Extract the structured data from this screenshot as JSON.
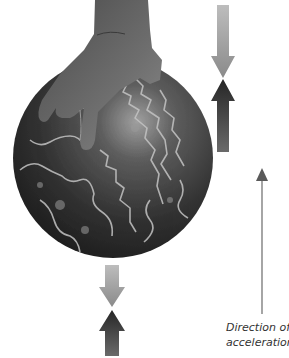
{
  "figure": {
    "caption": {
      "line1": "Direction of",
      "line2": "acceleration"
    },
    "arrows": {
      "ball_top_pair": [
        {
          "name": "downward-force",
          "direction": "down",
          "color": "#9a9a9a"
        },
        {
          "name": "upward-force",
          "direction": "up",
          "color": "#2e2e2e"
        }
      ],
      "ball_bottom_pair": [
        {
          "name": "downward-force",
          "direction": "down",
          "color": "#9a9a9a"
        },
        {
          "name": "upward-force",
          "direction": "up",
          "color": "#2e2e2e"
        }
      ],
      "acceleration": {
        "direction": "up",
        "color": "#555555"
      }
    },
    "colors": {
      "ball_dark": "#262626",
      "ball_highlight": "#8c8c8c",
      "marbling": "#c8c8c8",
      "hand": "#5a5a5a",
      "background": "#ffffff"
    }
  }
}
